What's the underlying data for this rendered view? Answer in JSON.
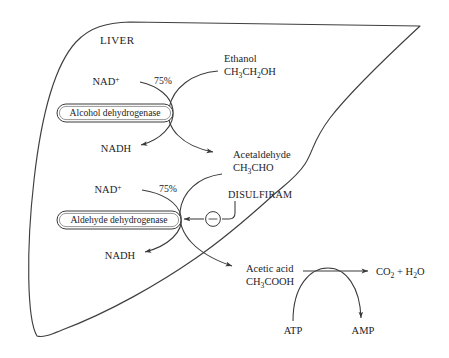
{
  "diagram": {
    "organ_label": "LIVER",
    "line_color": "#3a3a3c",
    "text_color": "#1d1d1f",
    "background": "#ffffff"
  },
  "substrates": {
    "ethanol": {
      "name": "Ethanol",
      "formula_pre": "CH",
      "formula_sub1": "3",
      "formula_mid": "CH",
      "formula_sub2": "2",
      "formula_post": "OH"
    },
    "acetaldehyde": {
      "name": "Acetaldehyde",
      "formula_pre": "CH",
      "formula_sub1": "3",
      "formula_post": "CHO"
    },
    "acetic_acid": {
      "name": "Acetic acid",
      "formula_pre": "CH",
      "formula_sub1": "3",
      "formula_post": "COOH"
    }
  },
  "products": {
    "final_pre": "CO",
    "final_sub1": "2",
    "final_mid": " + H",
    "final_sub2": "2",
    "final_post": "O"
  },
  "cofactors": {
    "nad_plus_1": {
      "base": "NAD",
      "charge": "+"
    },
    "nadh_1": "NADH",
    "nad_plus_2": {
      "base": "NAD",
      "charge": "+"
    },
    "nadh_2": "NADH",
    "atp": "ATP",
    "amp": "AMP"
  },
  "enzymes": [
    {
      "name": "Alcohol dehydrogenase",
      "yield_label": "75%"
    },
    {
      "name": "Aldehyde dehydrogenase",
      "yield_label": "75%"
    }
  ],
  "inhibitor": {
    "name": "DISULFIRAM",
    "symbol": "−",
    "symbol_name": "minus-sign"
  }
}
